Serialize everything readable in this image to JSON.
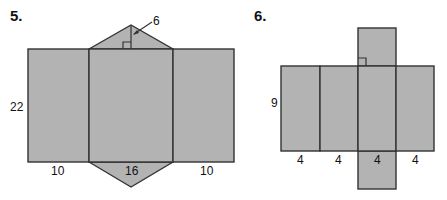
{
  "figure5": {
    "number": "5.",
    "shape": "triangular-prism-net",
    "labels": {
      "height": "22",
      "left_width": "10",
      "middle_width": "16",
      "right_width": "10",
      "triangle_height": "6"
    }
  },
  "figure6": {
    "number": "6.",
    "shape": "square-prism-net",
    "labels": {
      "height": "9",
      "widths": [
        "4",
        "4",
        "4",
        "4"
      ]
    }
  },
  "colors": {
    "face_fill": "#b3b3b3",
    "edge": "#333333"
  }
}
